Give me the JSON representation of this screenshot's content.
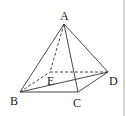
{
  "diagram": {
    "type": "pyramid",
    "labels": {
      "A": "A",
      "B": "B",
      "C": "C",
      "D": "D",
      "E": "E"
    },
    "vertices": {
      "A": [
        64,
        24
      ],
      "B": [
        20,
        92
      ],
      "C": [
        78,
        92
      ],
      "D": [
        108,
        72
      ],
      "E": [
        50,
        72
      ]
    },
    "solid_edges": [
      [
        "A",
        "B"
      ],
      [
        "A",
        "C"
      ],
      [
        "A",
        "D"
      ],
      [
        "B",
        "C"
      ],
      [
        "C",
        "D"
      ],
      [
        "B",
        "D"
      ]
    ],
    "dashed_edges": [
      [
        "A",
        "E"
      ],
      [
        "B",
        "E"
      ],
      [
        "E",
        "D"
      ]
    ],
    "line_color": "#333333"
  }
}
